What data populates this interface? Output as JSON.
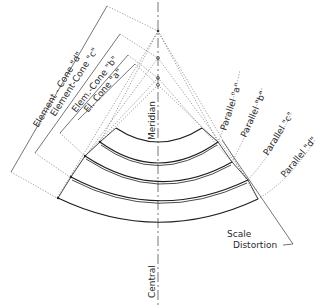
{
  "diagram": {
    "type": "polyconic-projection-construction",
    "background": "#ffffff",
    "ink": "#1e1e1e",
    "labels": {
      "element_cone_d": "Element - Cone \"d\"",
      "element_cone_c": "Element-Cone \"c\"",
      "elem_cone_b": "Elem.-Cone \"b\"",
      "el_cone_a": "El. Cone \"a\"",
      "meridian": "Meridian",
      "central": "Central",
      "parallel_a_top": "Parallel \"a\"",
      "parallel_b": "Parallel \"b\"",
      "parallel_c": "Parallel \"c\"",
      "parallel_d": "Parallel \"d\"",
      "scale": "Scale",
      "distortion": "Distortion"
    },
    "central_meridian_x": 158,
    "cone_apexes": [
      {
        "name": "cone-d-apex",
        "x": 158,
        "y": 31
      },
      {
        "name": "cone-c-apex",
        "x": 158,
        "y": 58
      },
      {
        "name": "cone-b-apex",
        "x": 158,
        "y": 78
      },
      {
        "name": "cone-a-apex",
        "x": 158,
        "y": 85
      }
    ],
    "bands": [
      {
        "name": "band-a",
        "upper_bottom_y": 144,
        "lower_bottom_y": 163
      },
      {
        "name": "band-b",
        "upper_bottom_y": 163,
        "lower_bottom_y": 182
      },
      {
        "name": "band-c",
        "upper_bottom_y": 182,
        "lower_bottom_y": 201
      },
      {
        "name": "band-d",
        "upper_bottom_y": 201,
        "lower_bottom_y": 222
      }
    ]
  }
}
